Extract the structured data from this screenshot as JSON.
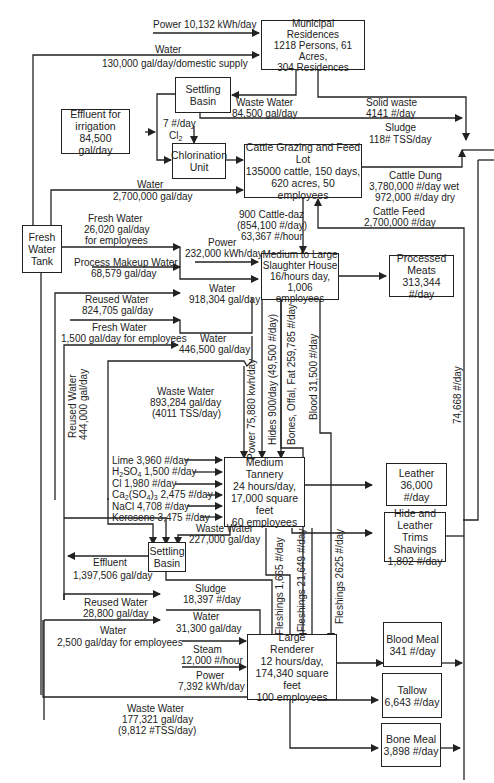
{
  "boxes": {
    "municipal": [
      "Municipal",
      "Residences",
      "1218 Persons, 61 Acres,",
      "304 Residences"
    ],
    "settling_basin_top": [
      "Settling",
      "Basin"
    ],
    "effluent_irrigation": [
      "Effluent for",
      "irrigation",
      "84,500 gal/day"
    ],
    "chlorination": [
      "Chlorination",
      "Unit"
    ],
    "feedlot": [
      "Cattle Grazing and Feed Lot",
      "135000 cattle, 150 days,",
      "620 acres, 50 employees"
    ],
    "fresh_water_tank": [
      "Fresh",
      "Water",
      "Tank"
    ],
    "slaughter_house": [
      "Medium to Large",
      "Slaughter House",
      "16/hours day,",
      "1,006 employees"
    ],
    "processed_meats": [
      "Processed",
      "Meats",
      "313,344 #/day"
    ],
    "tannery": [
      "Medium",
      "Tannery",
      "24 hours/day,",
      "17,000 square feet",
      "60 employees"
    ],
    "leather": [
      "Leather",
      "36,000 #/day"
    ],
    "hide_trims": [
      "Hide and",
      "Leather Trims",
      "Shavings",
      "1,802 #/day"
    ],
    "settling_basin_bottom": [
      "Settling",
      "Basin"
    ],
    "renderer": [
      "Large",
      "Renderer",
      "12 hours/day,",
      "174,340 square feet",
      "100 employees"
    ],
    "blood_meal": [
      "Blood Meal",
      "341 #/day"
    ],
    "tallow": [
      "Tallow",
      "6,643 #/day"
    ],
    "bone_meal": [
      "Bone Meal",
      "3,898 #/day"
    ]
  },
  "flows": {
    "power_municipal": "Power 10,132 kWh/day",
    "water_municipal": [
      "Water",
      "130,000 gal/day/domestic supply"
    ],
    "waste_water_municipal": [
      "Waste Water",
      "84,500 gal/day"
    ],
    "solid_waste": [
      "Solid waste",
      "4141 #/day"
    ],
    "sludge_top": [
      "Sludge",
      "118# TSS/day"
    ],
    "chlorine": [
      "7 #/day",
      "Cl2"
    ],
    "water_feedlot": [
      "Water",
      "2,700,000 gal/day"
    ],
    "cattle_dung": [
      "Cattle Dung",
      "3,780,000 #/day wet",
      "972,000 #/day dry"
    ],
    "cattle_feed": [
      "Cattle Feed",
      "2,700,000 #/day"
    ],
    "cattle_daz": [
      "900 Cattle-daz",
      "(854,100 #/day)",
      "63,367 #/hour"
    ],
    "fresh_water_employees": [
      "Fresh Water",
      "26,020 gal/day",
      "for employees"
    ],
    "power_slaughter": [
      "Power",
      "232,000 kWh/day"
    ],
    "process_makeup": [
      "Process Makeup Water",
      "68,579 gal/day"
    ],
    "water_slaughter": [
      "Water",
      "918,304 gal/day"
    ],
    "reused_water_824": [
      "Reused Water",
      "824,705 gal/day"
    ],
    "fresh_water_1500": [
      "Fresh Water",
      "1,500 gal/day for employees"
    ],
    "water_446": [
      "Water",
      "446,500 gal/day"
    ],
    "waste_water_893": [
      "Waste Water",
      "893,284 gal/day",
      "(4011 TSS/day)"
    ],
    "reused_water_444": [
      "Reused Water",
      "444,000 gal/day"
    ],
    "power_tannery": "Power 75,880 kwh/day",
    "hides": "Hides 900/day (49,500 #/day)",
    "bones_offal": "Bones, Offal, Fat 259,785 #/day",
    "blood": "Blood 31,500 #/day",
    "to_right_74668": "74,668 #/day",
    "chemicals": [
      "Lime 3,960 #/day",
      "H2SO4 1,500 #/day",
      "Cl 1,980 #/day",
      "Ca2(SO4)3 2,475 #/day",
      "NaCl 4,708 #/day",
      "Kerosene 3,475 #/day"
    ],
    "waste_water_227": [
      "Waste Water",
      "227,000 gal/day"
    ],
    "effluent_bottom": [
      "Effluent",
      "1,397,506 gal/day"
    ],
    "sludge_bottom": [
      "Sludge",
      "18,397 #/day"
    ],
    "reused_water_28800": [
      "Reused Water",
      "28,800 gal/day"
    ],
    "water_31300": [
      "Water",
      "31,300 gal/day"
    ],
    "water_2500": [
      "Water",
      "2,500 gal/day for employees"
    ],
    "steam": [
      "Steam",
      "12,000 #/hour"
    ],
    "power_renderer": [
      "Power",
      "7,392 kWh/day"
    ],
    "fleshings_1665": "Fleshings 1,665 #/day",
    "fleshings_21649": "Fleshings 21,649 #/day",
    "fleshings_2625": "Fleshings 2625 #/day",
    "waste_water_renderer": [
      "Waste Water",
      "177,321 gal/day",
      "(9,812 #TSS/day)"
    ]
  },
  "colors": {
    "line": "#222222",
    "background": "#ffffff"
  }
}
